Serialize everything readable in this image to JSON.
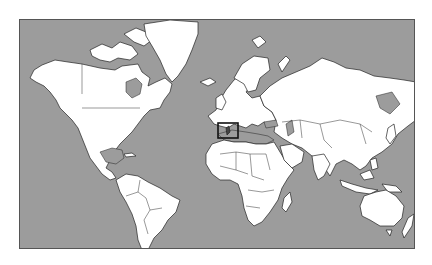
{
  "map": {
    "projection": "Mercator world map",
    "colors": {
      "ocean": "#9c9c9c",
      "land": "#ffffff",
      "borders": "#222222",
      "highlight_box": "#111111"
    },
    "highlight": {
      "region": "Tunisia / central Mediterranean",
      "box": {
        "x": 217,
        "y": 122,
        "width": 20,
        "height": 15
      }
    }
  }
}
